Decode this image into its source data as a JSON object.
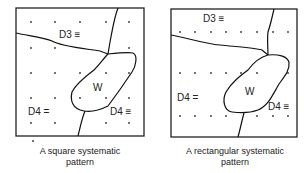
{
  "panels": [
    {
      "name": "square",
      "labels": {
        "d3": "D3 ≡",
        "w": "W",
        "d4_left": "D4 =",
        "d4_right": "D4 ≡"
      },
      "caption_line1": "A square systematic",
      "caption_line2": "pattern",
      "pattern": "square grid"
    },
    {
      "name": "rectangular",
      "labels": {
        "d3": "D3 ≡",
        "w": "W",
        "d4_left": "D4 =",
        "d4_right": "D4 ≡"
      },
      "caption_line1": "A rectangular systematic",
      "caption_line2": "pattern",
      "pattern": "rectangular grid"
    }
  ]
}
